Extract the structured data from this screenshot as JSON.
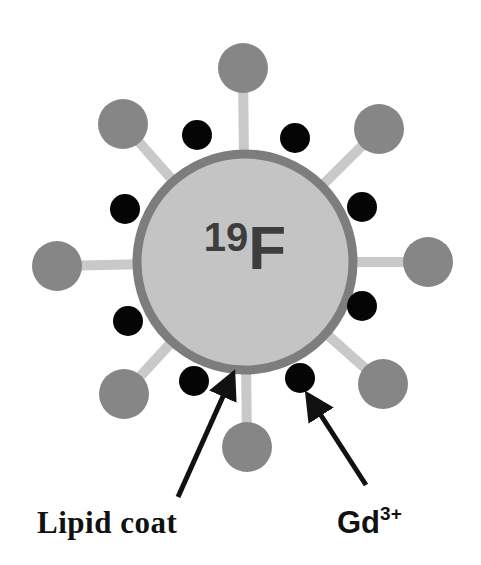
{
  "figure": {
    "core": {
      "isotope": "19",
      "element": "F",
      "center": [
        245,
        262
      ],
      "radius": 108,
      "fill": "#c4c4c4",
      "ring_color": "#7d7d7d",
      "ring_width": 9
    },
    "ligands": {
      "stem_color": "#c9c9c9",
      "ball_color": "#868686",
      "ball_radius": 25,
      "positions": [
        [
          243,
          68
        ],
        [
          379,
          129
        ],
        [
          428,
          262
        ],
        [
          383,
          384
        ],
        [
          247,
          447
        ],
        [
          124,
          394
        ],
        [
          57,
          266
        ],
        [
          123,
          124
        ]
      ]
    },
    "gd_ions": {
      "color": "#050505",
      "radius": 15,
      "positions": [
        [
          197,
          135
        ],
        [
          295,
          138
        ],
        [
          362,
          207
        ],
        [
          362,
          306
        ],
        [
          300,
          378
        ],
        [
          194,
          381
        ],
        [
          128,
          321
        ],
        [
          125,
          209
        ]
      ]
    },
    "labels": {
      "lipid_coat": "Lipid coat",
      "gd_base": "Gd",
      "gd_charge": "3+"
    },
    "arrows": {
      "lipid_coat": {
        "from": [
          178,
          497
        ],
        "to": [
          229,
          383
        ]
      },
      "gd": {
        "from": [
          366,
          485
        ],
        "to": [
          313,
          403
        ]
      }
    }
  }
}
